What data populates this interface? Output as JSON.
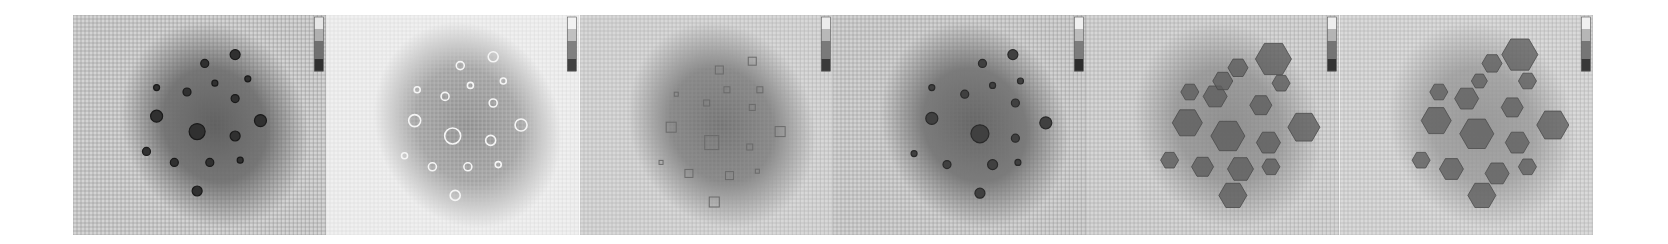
{
  "figure": {
    "panel_count": 6,
    "panels": [
      {
        "id": "panel-1",
        "background": "#d4d4d4",
        "grid_color": "#6e6e6e",
        "blob_color": "#3a3a3a",
        "blob_opacity": 0.75,
        "marker_style": "dark-ring",
        "marker_fill": "#303030",
        "marker_stroke": "#1a1a1a",
        "colorbar": [
          "#e6e6e6",
          "#b0b0b0",
          "#707070",
          "#303030"
        ],
        "markers": [
          [
            0.64,
            0.18,
            5
          ],
          [
            0.52,
            0.22,
            4
          ],
          [
            0.69,
            0.29,
            3
          ],
          [
            0.33,
            0.33,
            3
          ],
          [
            0.56,
            0.31,
            3
          ],
          [
            0.45,
            0.35,
            4
          ],
          [
            0.64,
            0.38,
            4
          ],
          [
            0.33,
            0.46,
            6
          ],
          [
            0.74,
            0.48,
            6
          ],
          [
            0.49,
            0.53,
            8
          ],
          [
            0.64,
            0.55,
            5
          ],
          [
            0.29,
            0.62,
            4
          ],
          [
            0.4,
            0.67,
            4
          ],
          [
            0.54,
            0.67,
            4
          ],
          [
            0.66,
            0.66,
            3
          ],
          [
            0.49,
            0.8,
            5
          ]
        ]
      },
      {
        "id": "panel-2",
        "background": "#f0f0f0",
        "grid_color": "#cfcfcf",
        "blob_color": "#505050",
        "blob_opacity": 0.6,
        "marker_style": "light-ring",
        "marker_fill": "none",
        "marker_stroke": "#f5f5f5",
        "colorbar": [
          "#f2f2f2",
          "#c0c0c0",
          "#808080",
          "#404040"
        ],
        "markers": [
          [
            0.66,
            0.19,
            5
          ],
          [
            0.53,
            0.23,
            4
          ],
          [
            0.7,
            0.3,
            3
          ],
          [
            0.36,
            0.34,
            3
          ],
          [
            0.57,
            0.32,
            3
          ],
          [
            0.47,
            0.37,
            4
          ],
          [
            0.66,
            0.4,
            4
          ],
          [
            0.35,
            0.48,
            6
          ],
          [
            0.77,
            0.5,
            6
          ],
          [
            0.5,
            0.55,
            8
          ],
          [
            0.65,
            0.57,
            5
          ],
          [
            0.31,
            0.64,
            3
          ],
          [
            0.42,
            0.69,
            4
          ],
          [
            0.56,
            0.69,
            4
          ],
          [
            0.68,
            0.68,
            3
          ],
          [
            0.51,
            0.82,
            5
          ]
        ]
      },
      {
        "id": "panel-3",
        "background": "#d8d8d8",
        "grid_color": "#9a9a9a",
        "blob_color": "#4a4a4a",
        "blob_opacity": 0.7,
        "marker_style": "faint-square",
        "marker_fill": "none",
        "marker_stroke": "#6a6a6a",
        "colorbar": [
          "#ececec",
          "#b8b8b8",
          "#7a7a7a",
          "#3a3a3a"
        ],
        "markers": [
          [
            0.68,
            0.21,
            4
          ],
          [
            0.55,
            0.25,
            4
          ],
          [
            0.71,
            0.34,
            3
          ],
          [
            0.38,
            0.36,
            2
          ],
          [
            0.58,
            0.34,
            3
          ],
          [
            0.5,
            0.4,
            3
          ],
          [
            0.68,
            0.42,
            3
          ],
          [
            0.36,
            0.51,
            5
          ],
          [
            0.79,
            0.53,
            5
          ],
          [
            0.52,
            0.58,
            7
          ],
          [
            0.67,
            0.6,
            3
          ],
          [
            0.32,
            0.67,
            2
          ],
          [
            0.43,
            0.72,
            4
          ],
          [
            0.59,
            0.73,
            4
          ],
          [
            0.7,
            0.71,
            2
          ],
          [
            0.53,
            0.85,
            5
          ]
        ]
      },
      {
        "id": "panel-4",
        "background": "#d2d2d2",
        "grid_color": "#7a7a7a",
        "blob_color": "#3c3c3c",
        "blob_opacity": 0.72,
        "marker_style": "dark-blot",
        "marker_fill": "#404040",
        "marker_stroke": "#2a2a2a",
        "colorbar": [
          "#f0f0f0",
          "#bcbcbc",
          "#7c7c7c",
          "#2c2c2c"
        ],
        "markers": [
          [
            0.71,
            0.18,
            5
          ],
          [
            0.59,
            0.22,
            4
          ],
          [
            0.74,
            0.3,
            3
          ],
          [
            0.39,
            0.33,
            3
          ],
          [
            0.63,
            0.32,
            3
          ],
          [
            0.52,
            0.36,
            4
          ],
          [
            0.72,
            0.4,
            4
          ],
          [
            0.39,
            0.47,
            6
          ],
          [
            0.84,
            0.49,
            6
          ],
          [
            0.58,
            0.54,
            9
          ],
          [
            0.72,
            0.56,
            4
          ],
          [
            0.32,
            0.63,
            3
          ],
          [
            0.45,
            0.68,
            4
          ],
          [
            0.63,
            0.68,
            5
          ],
          [
            0.73,
            0.67,
            3
          ],
          [
            0.58,
            0.81,
            5
          ]
        ]
      },
      {
        "id": "panel-5",
        "background": "#d6d6d6",
        "grid_color": "#8a8a8a",
        "blob_color": "#5a5a5a",
        "blob_opacity": 0.55,
        "marker_style": "hexagon",
        "marker_fill": "#5e5e5e",
        "marker_stroke": "#4a4a4a",
        "colorbar": [
          "#eeeeee",
          "#b4b4b4",
          "#747474",
          "#343434"
        ],
        "markers": [
          [
            0.74,
            0.2,
            18
          ],
          [
            0.6,
            0.24,
            10
          ],
          [
            0.77,
            0.31,
            9
          ],
          [
            0.41,
            0.35,
            9
          ],
          [
            0.51,
            0.37,
            12
          ],
          [
            0.69,
            0.41,
            11
          ],
          [
            0.4,
            0.49,
            15
          ],
          [
            0.86,
            0.51,
            16
          ],
          [
            0.56,
            0.55,
            17
          ],
          [
            0.72,
            0.58,
            12
          ],
          [
            0.33,
            0.66,
            9
          ],
          [
            0.46,
            0.69,
            11
          ],
          [
            0.61,
            0.7,
            13
          ],
          [
            0.73,
            0.69,
            9
          ],
          [
            0.58,
            0.82,
            14
          ],
          [
            0.54,
            0.3,
            10
          ]
        ]
      },
      {
        "id": "panel-6",
        "background": "#dadada",
        "grid_color": "#949494",
        "blob_color": "#5c5c5c",
        "blob_opacity": 0.5,
        "marker_style": "hexagon",
        "marker_fill": "#606060",
        "marker_stroke": "#4c4c4c",
        "colorbar": [
          "#f0f0f0",
          "#b6b6b6",
          "#767676",
          "#383838"
        ],
        "markers": [
          [
            0.71,
            0.18,
            18
          ],
          [
            0.6,
            0.22,
            10
          ],
          [
            0.74,
            0.3,
            9
          ],
          [
            0.39,
            0.35,
            9
          ],
          [
            0.5,
            0.38,
            12
          ],
          [
            0.68,
            0.42,
            11
          ],
          [
            0.38,
            0.48,
            15
          ],
          [
            0.84,
            0.5,
            16
          ],
          [
            0.54,
            0.54,
            17
          ],
          [
            0.7,
            0.58,
            12
          ],
          [
            0.32,
            0.66,
            9
          ],
          [
            0.44,
            0.7,
            12
          ],
          [
            0.62,
            0.72,
            12
          ],
          [
            0.74,
            0.69,
            9
          ],
          [
            0.56,
            0.82,
            14
          ],
          [
            0.55,
            0.3,
            8
          ]
        ]
      }
    ]
  }
}
